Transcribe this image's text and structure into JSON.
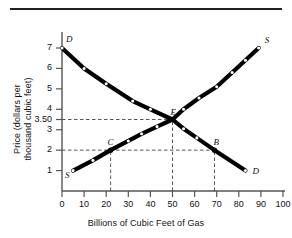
{
  "figure": {
    "has_top_rule": true,
    "background_color": "#ffffff",
    "ink_color": "#111111"
  },
  "chart_data": {
    "type": "line",
    "title": "",
    "subtitle": "",
    "xlabel": "Billions of Cubic Feet of Gas",
    "ylabel": "Price (dollars per thousand cubic feet)",
    "ylabel_lines": [
      "Price (dollars per",
      "thousand cubic feet)"
    ],
    "xlim": [
      0,
      100
    ],
    "ylim": [
      0,
      7.6
    ],
    "grid": false,
    "legend": "none",
    "xticks": [
      0,
      10,
      20,
      30,
      40,
      50,
      60,
      70,
      80,
      90,
      100
    ],
    "xticklabels": [
      "0",
      "10",
      "20",
      "30",
      "40",
      "50",
      "60",
      "70",
      "80",
      "90",
      "100"
    ],
    "yticks": [
      1,
      2,
      3,
      3.5,
      4,
      5,
      6,
      7
    ],
    "yticklabels": [
      "1",
      "2",
      "3",
      "3.50",
      "4",
      "5",
      "6",
      "7"
    ],
    "series": [
      {
        "name": "Demand",
        "label": "D",
        "label_positions": [
          "start",
          "end"
        ],
        "x": [
          0,
          10,
          20,
          32,
          40,
          50,
          55,
          61,
          69,
          83
        ],
        "y": [
          7,
          6,
          5.25,
          4.4,
          4,
          3.5,
          3.05,
          2.6,
          2.0,
          1.0
        ]
      },
      {
        "name": "Supply",
        "label": "S",
        "label_positions": [
          "start",
          "end"
        ],
        "x": [
          5,
          14,
          22,
          30,
          36,
          43,
          50,
          55,
          62,
          70,
          77,
          83,
          89
        ],
        "y": [
          1.0,
          1.5,
          2.0,
          2.45,
          2.8,
          3.15,
          3.5,
          4.0,
          4.55,
          5.1,
          5.8,
          6.4,
          7.0
        ]
      }
    ],
    "annotations": [
      {
        "id": "E",
        "label": "E",
        "x": 50,
        "y": 3.5,
        "description": "equilibrium point"
      },
      {
        "id": "C",
        "label": "C",
        "x": 22,
        "y": 2.0,
        "description": "quantity supplied at price 2"
      },
      {
        "id": "B",
        "label": "B",
        "x": 69,
        "y": 2.0,
        "description": "quantity demanded at price 2"
      }
    ],
    "guide_lines": [
      {
        "orientation": "horizontal",
        "value": 3.5,
        "from_x": 0,
        "to_x": 50,
        "style": "dashed"
      },
      {
        "orientation": "horizontal",
        "value": 2.0,
        "from_x": 0,
        "to_x": 69,
        "style": "dashed"
      },
      {
        "orientation": "vertical",
        "value": 22,
        "from_y": 0,
        "to_y": 2.0,
        "style": "dashed"
      },
      {
        "orientation": "vertical",
        "value": 50,
        "from_y": 0,
        "to_y": 3.5,
        "style": "dashed"
      },
      {
        "orientation": "vertical",
        "value": 69,
        "from_y": 0,
        "to_y": 2.0,
        "style": "dashed"
      }
    ],
    "curve_end_labels": [
      {
        "text": "D",
        "series": "Demand",
        "at": "top-left",
        "x": 0,
        "y": 7
      },
      {
        "text": "D",
        "series": "Demand",
        "at": "bottom-right",
        "x": 83,
        "y": 1
      },
      {
        "text": "S",
        "series": "Supply",
        "at": "bottom-left",
        "x": 5,
        "y": 1
      },
      {
        "text": "S",
        "series": "Supply",
        "at": "top-right",
        "x": 89,
        "y": 7
      }
    ]
  }
}
